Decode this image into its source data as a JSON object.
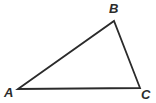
{
  "figure": {
    "name": "triangle-ABC",
    "background_color": "#ffffff",
    "stroke_color": "#2b2b2b",
    "stroke_width": 1.8,
    "labels": {
      "a": "A",
      "b": "B",
      "c": "C"
    },
    "label_color": "#2b2b2b"
  },
  "chart_data": {
    "type": "diagram",
    "shape": "triangle",
    "title": "",
    "vertices": [
      {
        "name": "A",
        "x": 18,
        "y": 89,
        "label": "A",
        "label_x": 4,
        "label_y": 86,
        "label_position": "left-below"
      },
      {
        "name": "B",
        "x": 114,
        "y": 21,
        "label": "B",
        "label_x": 109,
        "label_y": 2,
        "label_position": "above"
      },
      {
        "name": "C",
        "x": 140,
        "y": 88,
        "label": "C",
        "label_x": 141,
        "label_y": 88,
        "label_position": "right-below"
      }
    ],
    "edges": [
      {
        "name": "AB",
        "from": "A",
        "to": "B"
      },
      {
        "name": "BC",
        "from": "B",
        "to": "C"
      },
      {
        "name": "CA",
        "from": "C",
        "to": "A"
      }
    ],
    "xlim": [
      0,
      156
    ],
    "ylim": [
      0,
      103
    ],
    "grid": false,
    "legend": false
  }
}
